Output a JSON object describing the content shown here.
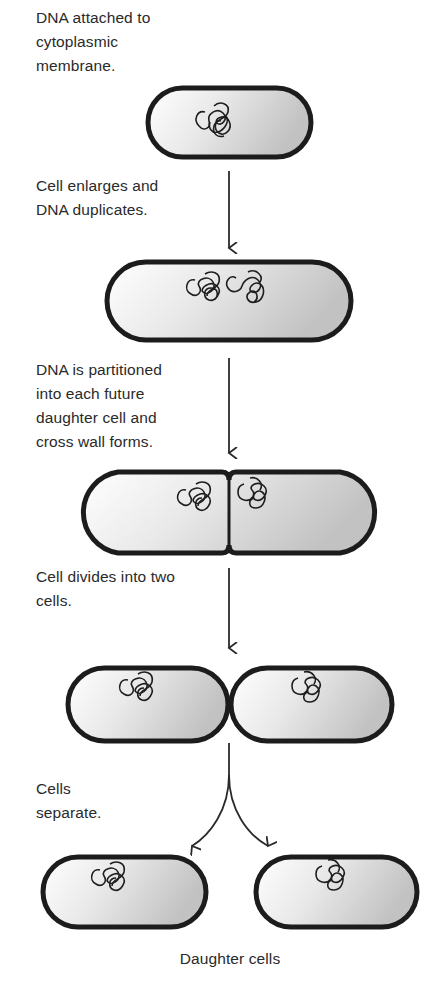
{
  "diagram": {
    "steps": [
      {
        "id": 1,
        "caption": "DNA attached to\ncytoplasmic\nmembrane."
      },
      {
        "id": 2,
        "caption": "Cell enlarges and\nDNA duplicates."
      },
      {
        "id": 3,
        "caption": "DNA is partitioned\ninto each future\ndaughter cell and\ncross wall forms."
      },
      {
        "id": 4,
        "caption": "Cell divides into two\ncells."
      },
      {
        "id": 5,
        "caption": "Cells\nseparate."
      }
    ],
    "final_label": "Daughter cells",
    "colors": {
      "cell_wall": "#1c1c1c",
      "cell_fill_light": "#ffffff",
      "cell_fill_dark": "#c4c4c4",
      "text": "#2a2a2a"
    }
  }
}
